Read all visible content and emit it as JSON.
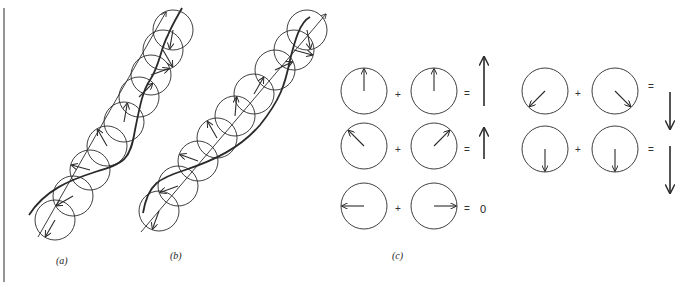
{
  "figure": {
    "stroke_color": "#2a2a2a",
    "background": "#ffffff",
    "border_line": {
      "x": 4,
      "y1": 8,
      "y2": 282
    },
    "labels": {
      "a": "(a)",
      "b": "(b)",
      "c": "(c)"
    },
    "panel_a": {
      "axis": {
        "x1": 38,
        "y1": 237,
        "x2": 166,
        "y2": 12
      },
      "circle_radius": 20,
      "circles": [
        {
          "cx": 55,
          "cy": 220,
          "arrow_angle": 240
        },
        {
          "cx": 73,
          "cy": 196,
          "arrow_angle": 210
        },
        {
          "cx": 90,
          "cy": 170,
          "arrow_angle": 165
        },
        {
          "cx": 107,
          "cy": 146,
          "arrow_angle": 120
        },
        {
          "cx": 124,
          "cy": 122,
          "arrow_angle": 80
        },
        {
          "cx": 139,
          "cy": 97,
          "arrow_angle": 45
        },
        {
          "cx": 151,
          "cy": 75,
          "arrow_angle": 20
        },
        {
          "cx": 163,
          "cy": 50,
          "arrow_angle": 300
        },
        {
          "cx": 173,
          "cy": 30,
          "arrow_angle": 260
        }
      ],
      "curve": "M29,215 C45,190 70,180 95,172 C125,163 130,160 135,130 C140,105 143,90 150,80 C160,65 160,50 168,35 C172,25 180,12 182,8"
    },
    "panel_b": {
      "axis": {
        "x1": 141,
        "y1": 232,
        "x2": 326,
        "y2": 14
      },
      "circle_radius": 20,
      "circles": [
        {
          "cx": 159,
          "cy": 211,
          "arrow_angle": 250
        },
        {
          "cx": 178,
          "cy": 186,
          "arrow_angle": 200
        },
        {
          "cx": 198,
          "cy": 161,
          "arrow_angle": 160
        },
        {
          "cx": 217,
          "cy": 138,
          "arrow_angle": 120
        },
        {
          "cx": 235,
          "cy": 116,
          "arrow_angle": 85
        },
        {
          "cx": 254,
          "cy": 94,
          "arrow_angle": 60
        },
        {
          "cx": 275,
          "cy": 70,
          "arrow_angle": 25
        },
        {
          "cx": 294,
          "cy": 50,
          "arrow_angle": 345
        },
        {
          "cx": 307,
          "cy": 30,
          "arrow_angle": 280
        }
      ],
      "curve": "M143,213 C148,183 160,178 185,170 C215,160 240,148 260,125 C280,100 285,85 290,60 C295,40 300,22 310,17"
    },
    "panel_c": {
      "circle_radius": 23,
      "rows": [
        {
          "left": {
            "cx": 364,
            "cy": 91,
            "arrow_angle": 90
          },
          "plus": "+",
          "plus_x": 398,
          "plus_y": 96,
          "right": {
            "cx": 434,
            "cy": 91,
            "arrow_angle": 90
          },
          "equals": "=",
          "equals_x": 467,
          "equals_y": 95,
          "result": {
            "type": "arrow",
            "x": 484,
            "y1": 106,
            "y2": 57,
            "dir": "up"
          }
        },
        {
          "left": {
            "cx": 364,
            "cy": 146,
            "arrow_angle": 135
          },
          "plus": "+",
          "plus_x": 398,
          "plus_y": 151,
          "right": {
            "cx": 434,
            "cy": 146,
            "arrow_angle": 45
          },
          "equals": "=",
          "equals_x": 467,
          "equals_y": 151,
          "result": {
            "type": "arrow",
            "x": 484,
            "y1": 159,
            "y2": 128,
            "dir": "up"
          }
        },
        {
          "left": {
            "cx": 364,
            "cy": 206,
            "arrow_angle": 180
          },
          "plus": "+",
          "plus_x": 398,
          "plus_y": 210,
          "right": {
            "cx": 434,
            "cy": 206,
            "arrow_angle": 0
          },
          "equals": "=",
          "equals_x": 467,
          "equals_y": 210,
          "result": {
            "type": "text",
            "value": "0",
            "x": 480,
            "y": 210
          }
        },
        {
          "left": {
            "cx": 545,
            "cy": 91,
            "arrow_angle": 225
          },
          "plus": "+",
          "plus_x": 578,
          "plus_y": 95,
          "right": {
            "cx": 615,
            "cy": 91,
            "arrow_angle": 315
          },
          "equals": "=",
          "equals_x": 651,
          "equals_y": 88,
          "result": {
            "type": "arrow",
            "x": 670,
            "y1": 92,
            "y2": 129,
            "dir": "down"
          }
        },
        {
          "left": {
            "cx": 545,
            "cy": 149,
            "arrow_angle": 270
          },
          "plus": "+",
          "plus_x": 578,
          "plus_y": 151,
          "right": {
            "cx": 615,
            "cy": 149,
            "arrow_angle": 270
          },
          "equals": "=",
          "equals_x": 651,
          "equals_y": 151,
          "result": {
            "type": "arrow",
            "x": 670,
            "y1": 146,
            "y2": 193,
            "dir": "down"
          }
        }
      ]
    },
    "label_positions": {
      "a": {
        "x": 56,
        "y": 255
      },
      "b": {
        "x": 170,
        "y": 250
      },
      "c": {
        "x": 392,
        "y": 250
      }
    }
  }
}
